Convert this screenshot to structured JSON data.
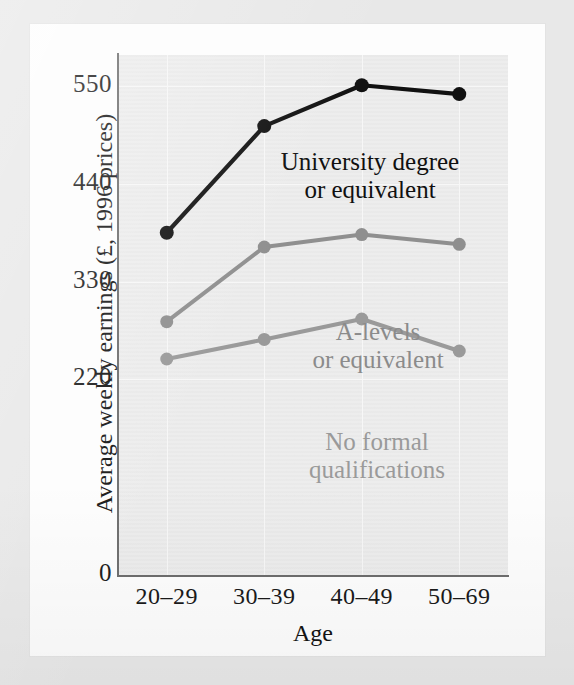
{
  "chart_data": {
    "type": "line",
    "title": "",
    "xlabel": "Age",
    "ylabel": "Average weekly earnings (£, 1996 prices)",
    "categories": [
      "20–29",
      "30–39",
      "40–49",
      "50–69"
    ],
    "yticks": [
      "0",
      "220",
      "330",
      "440",
      "550"
    ],
    "ytick_values": [
      0,
      220,
      330,
      440,
      550
    ],
    "ylim": [
      0,
      585
    ],
    "grid": true,
    "legend_position": "inline-annotations",
    "series": [
      {
        "name": "University degree or equivalent",
        "label_line1": "University degree",
        "label_line2": "or equivalent",
        "color": "#111111",
        "values": [
          385,
          505,
          551,
          541
        ]
      },
      {
        "name": "A-levels or equivalent",
        "label_line1": "A-levels",
        "label_line2": "or equivalent",
        "color": "#8f8f8f",
        "values": [
          285,
          369,
          383,
          372
        ]
      },
      {
        "name": "No formal qualifications",
        "label_line1": "No formal",
        "label_line2": "qualifications",
        "color": "#9a9a9a",
        "values": [
          243,
          265,
          288,
          252
        ]
      }
    ]
  },
  "colors": {
    "page_background": "#fdfdfd",
    "frame_background": "#e8e8e8",
    "plot_background": "#ebebeb",
    "axis": "#6d6d6d",
    "gridline": "#f7f7f7",
    "text": "#141414"
  }
}
